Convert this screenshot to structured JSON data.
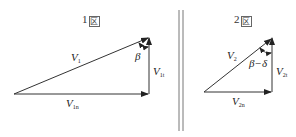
{
  "diagrams": [
    {
      "id": "zone1",
      "title_num": "1",
      "title_char": "区",
      "vectors": {
        "resultant": {
          "symbol": "V",
          "sub": "1"
        },
        "normal": {
          "symbol": "V",
          "sub": "1n"
        },
        "tangential": {
          "symbol": "V",
          "sub": "1t"
        }
      },
      "angle_label": "β"
    },
    {
      "id": "zone2",
      "title_num": "2",
      "title_char": "区",
      "vectors": {
        "resultant": {
          "symbol": "V",
          "sub": "2"
        },
        "normal": {
          "symbol": "V",
          "sub": "2n"
        },
        "tangential": {
          "symbol": "V",
          "sub": "2t"
        }
      },
      "angle_label": "β−δ"
    }
  ],
  "separator": "double-vertical-line",
  "colors": {
    "line": "#333333",
    "background": "#ffffff"
  }
}
